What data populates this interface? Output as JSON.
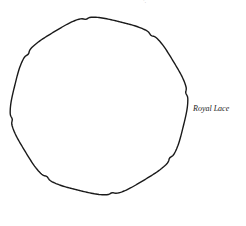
{
  "diagram": {
    "label": "Royal Lace",
    "top_mark": "·,",
    "outline": {
      "cx": 99,
      "cy": 106,
      "r": 88,
      "notches": 8,
      "stroke": "#1a1a1a",
      "stroke_width": 1.4
    }
  }
}
